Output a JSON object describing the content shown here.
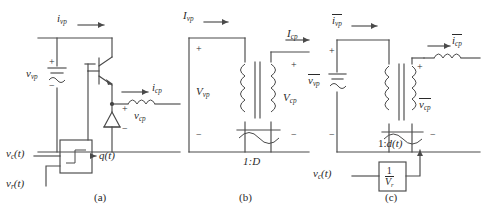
{
  "figure": {
    "type": "circuit-diagram-set",
    "panel_count": 3,
    "captions": {
      "a": "(a)",
      "b": "(b)",
      "c": "(c)"
    }
  },
  "panel_a": {
    "caption": "(a)",
    "description": "switch-network-with-pwm-comparator",
    "labels": {
      "input_current": {
        "base": "i",
        "sub": "vp"
      },
      "input_voltage": {
        "base": "v",
        "sub": "vp"
      },
      "output_current": {
        "base": "i",
        "sub": "cp"
      },
      "output_voltage": {
        "base": "v",
        "sub": "cp"
      },
      "gate_signal": {
        "base": "q",
        "arg": "(t)"
      },
      "control_input": {
        "base": "v",
        "sub": "c",
        "arg": "(t)"
      },
      "ramp_input": {
        "base": "v",
        "sub": "r",
        "arg": "(t)"
      }
    },
    "polarity": {
      "plus": "+",
      "minus": "−"
    },
    "components": [
      "igbt-transistor",
      "diode",
      "inductor",
      "dc-source",
      "pwm-comparator-block"
    ]
  },
  "panel_b": {
    "caption": "(b)",
    "description": "ideal-dc-transformer-model",
    "labels": {
      "input_current": {
        "base": "I",
        "sub": "vp"
      },
      "input_voltage": {
        "base": "V",
        "sub": "vp"
      },
      "output_current": {
        "base": "I",
        "sub": "cp"
      },
      "output_voltage": {
        "base": "V",
        "sub": "cp"
      },
      "turns_ratio": "1:D"
    },
    "polarity": {
      "plus": "+",
      "minus": "−"
    },
    "components": [
      "dc-transformer",
      "polarity-dots"
    ]
  },
  "panel_c": {
    "caption": "(c)",
    "description": "averaged-model-with-duty-cycle-modulator",
    "labels": {
      "input_current": {
        "base": "i",
        "sub": "vp",
        "overbar": true
      },
      "input_voltage": {
        "base": "v",
        "sub": "vp",
        "overbar": true
      },
      "output_current": {
        "base": "i",
        "sub": "cp",
        "overbar": true
      },
      "output_voltage": {
        "base": "v",
        "sub": "cp",
        "overbar": true
      },
      "turns_ratio": "1:",
      "turns_ratio_duty": {
        "base": "d",
        "arg": "(t)"
      },
      "control_input": {
        "base": "v",
        "sub": "c",
        "arg": "(t)"
      },
      "gain_block": {
        "numerator": "1",
        "denominator": "V",
        "denominator_sub": "r"
      }
    },
    "polarity": {
      "plus": "+",
      "minus": "−"
    },
    "components": [
      "dc-transformer",
      "inductor",
      "dc-source",
      "gain-block",
      "polarity-dots"
    ]
  },
  "colors": {
    "background": "#ffffff",
    "wire": "#4a4a4a",
    "text": "#2a2a2a"
  }
}
